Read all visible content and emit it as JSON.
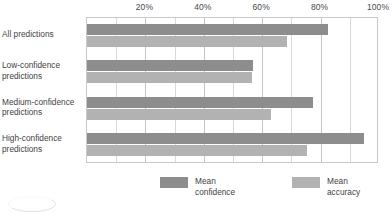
{
  "chart_data": {
    "type": "bar",
    "orientation": "horizontal",
    "title": "",
    "xlabel": "",
    "ylabel": "",
    "xlim": [
      0,
      100
    ],
    "xticks": [
      0,
      20,
      40,
      60,
      80,
      100
    ],
    "xtick_labels": [
      "",
      "20%",
      "40%",
      "60%",
      "80%",
      "100%"
    ],
    "minor_tick_step": 10,
    "grid": true,
    "grid_axis": "x",
    "legend_position": "bottom",
    "categories": [
      "All predictions",
      "Low-confidence predictions",
      "Medium-confidence predictions",
      "High-confidence predictions"
    ],
    "category_lines": [
      [
        "All predictions"
      ],
      [
        "Low-confidence",
        "predictions"
      ],
      [
        "Medium-confidence",
        "predictions"
      ],
      [
        "High-confidence",
        "predictions"
      ]
    ],
    "series": [
      {
        "name": "Mean confidence",
        "name_lines": [
          "Mean",
          "confidence"
        ],
        "color": "#8d8d8d",
        "values": [
          82.5,
          57.0,
          77.5,
          95.0
        ]
      },
      {
        "name": "Mean accuracy",
        "name_lines": [
          "Mean",
          "accuracy"
        ],
        "color": "#b2b2b2",
        "values": [
          68.5,
          56.5,
          63.0,
          75.5
        ]
      }
    ]
  },
  "colors": {
    "confidence": "#8d8d8d",
    "accuracy": "#b2b2b2",
    "grid": "#d8d8d8",
    "axis_border": "#c9c9c9",
    "text": "#3f3f3f",
    "background": "#ffffff"
  },
  "legend": {
    "items": [
      {
        "label_line1": "Mean",
        "label_line2": "confidence",
        "swatch": "confidence"
      },
      {
        "label_line1": "Mean",
        "label_line2": "accuracy",
        "swatch": "accuracy"
      }
    ]
  }
}
